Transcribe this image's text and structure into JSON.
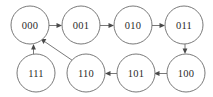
{
  "diagram": {
    "title": "",
    "type": "state-transition-graph",
    "background_color": "#ffffff",
    "node_stroke_color": "#6a6a6a",
    "node_fill_color": "#ffffff",
    "label_color": "#2b2b2b",
    "edge_color": "#6a6a6a",
    "arrowhead_color": "#4a4a4a",
    "node_radius": 19,
    "nodes": [
      {
        "id": "n000",
        "label": "000",
        "cx": 30,
        "cy": 25
      },
      {
        "id": "n001",
        "label": "001",
        "cx": 81,
        "cy": 25
      },
      {
        "id": "n010",
        "label": "010",
        "cx": 133,
        "cy": 25
      },
      {
        "id": "n011",
        "label": "011",
        "cx": 184,
        "cy": 25
      },
      {
        "id": "n111",
        "label": "111",
        "cx": 36,
        "cy": 73
      },
      {
        "id": "n110",
        "label": "110",
        "cx": 86,
        "cy": 73
      },
      {
        "id": "n101",
        "label": "101",
        "cx": 136,
        "cy": 73
      },
      {
        "id": "n100",
        "label": "100",
        "cx": 186,
        "cy": 73
      }
    ],
    "edges": [
      {
        "from": "000",
        "to": "001",
        "direction": "right"
      },
      {
        "from": "001",
        "to": "010",
        "direction": "right"
      },
      {
        "from": "010",
        "to": "011",
        "direction": "right"
      },
      {
        "from": "011",
        "to": "100",
        "direction": "down"
      },
      {
        "from": "100",
        "to": "101",
        "direction": "left"
      },
      {
        "from": "101",
        "to": "110",
        "direction": "left"
      },
      {
        "from": "110",
        "to": "000",
        "direction": "diagonal-up-left"
      },
      {
        "from": "111",
        "to": "000",
        "direction": "up"
      }
    ]
  }
}
